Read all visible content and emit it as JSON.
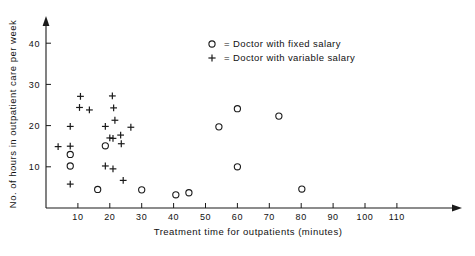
{
  "chart_data": {
    "type": "scatter",
    "title": "",
    "xlabel": "Treatment time for outpatients (minutes)",
    "ylabel": "No. of hours in outpatient care per week",
    "xlim": [
      0,
      115
    ],
    "ylim": [
      0,
      46
    ],
    "xticks": [
      10,
      20,
      30,
      40,
      50,
      60,
      70,
      80,
      90,
      100,
      110
    ],
    "xtick_labels": [
      "10",
      "20",
      "30",
      "40",
      "50",
      "60",
      "70",
      "80",
      "90",
      "100",
      "110"
    ],
    "yticks": [
      10,
      20,
      30,
      40
    ],
    "ytick_labels": [
      "10",
      "20",
      "30",
      "40"
    ],
    "grid": false,
    "legend_position": "upper-center",
    "series": [
      {
        "name": "Doctor with fixed salary",
        "marker": "circle",
        "legend_label": "= Doctor with fixed salary",
        "points": [
          [
            7.6,
            13.0
          ],
          [
            7.6,
            10.2
          ],
          [
            18.6,
            15.1
          ],
          [
            16.2,
            4.5
          ],
          [
            30.0,
            4.4
          ],
          [
            40.7,
            3.2
          ],
          [
            44.8,
            3.7
          ],
          [
            54.2,
            19.7
          ],
          [
            60.0,
            24.1
          ],
          [
            60.0,
            10.0
          ],
          [
            73.0,
            22.3
          ],
          [
            80.2,
            4.6
          ]
        ]
      },
      {
        "name": "Doctor with variable salary",
        "marker": "plus",
        "legend_label": "= Doctor with variable salary",
        "points": [
          [
            3.8,
            14.9
          ],
          [
            7.6,
            19.8
          ],
          [
            7.6,
            15.0
          ],
          [
            7.6,
            5.8
          ],
          [
            10.8,
            27.1
          ],
          [
            10.5,
            24.4
          ],
          [
            13.6,
            23.8
          ],
          [
            18.6,
            19.8
          ],
          [
            18.6,
            10.2
          ],
          [
            20.8,
            27.2
          ],
          [
            21.2,
            24.3
          ],
          [
            21.6,
            21.3
          ],
          [
            20.0,
            17.0
          ],
          [
            21.0,
            16.9
          ],
          [
            23.4,
            17.7
          ],
          [
            23.6,
            15.6
          ],
          [
            21.0,
            9.5
          ],
          [
            24.2,
            6.7
          ],
          [
            26.6,
            19.6
          ]
        ]
      }
    ]
  },
  "legend": {
    "fixed_symbol": "circle",
    "fixed_label": "= Doctor with fixed salary",
    "variable_symbol": "plus",
    "variable_label": "= Doctor with variable salary"
  },
  "axes": {
    "x_title": "Treatment time for outpatients (minutes)",
    "y_title": "No. of hours in outpatient care per week"
  },
  "colors": {
    "ink": "#1a1a1a",
    "background": "#ffffff"
  }
}
